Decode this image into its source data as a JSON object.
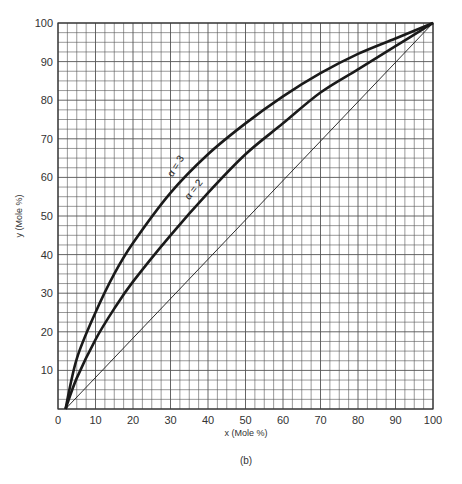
{
  "chart_data": {
    "type": "line",
    "title": "",
    "caption": "(b)",
    "xlabel": "x  (Mole %)",
    "ylabel": "y  (Mole %)",
    "xlim": [
      0,
      100
    ],
    "ylim": [
      0,
      100
    ],
    "grid": true,
    "grid_minor_step": 2.5,
    "x_ticks": [
      "0",
      "10",
      "20",
      "30",
      "40",
      "50",
      "60",
      "70",
      "80",
      "90",
      "100"
    ],
    "y_ticks": [
      "10",
      "20",
      "30",
      "40",
      "50",
      "60",
      "70",
      "80",
      "90",
      "100"
    ],
    "series": [
      {
        "name": "α = 3",
        "label": "α = 3",
        "x": [
          2,
          5,
          10,
          15,
          20,
          30,
          40,
          50,
          60,
          70,
          80,
          90,
          100
        ],
        "y": [
          0,
          13,
          25,
          35,
          43,
          56,
          66,
          74,
          81,
          87,
          92,
          96,
          100
        ]
      },
      {
        "name": "α = 2",
        "label": "α = 2",
        "x": [
          2,
          5,
          10,
          15,
          20,
          30,
          40,
          50,
          60,
          70,
          80,
          90,
          100
        ],
        "y": [
          0,
          8,
          18,
          26,
          33,
          45,
          56,
          66,
          74,
          82,
          88,
          94,
          100
        ]
      },
      {
        "name": "diagonal",
        "label": "",
        "x": [
          2,
          100
        ],
        "y": [
          0,
          100
        ]
      }
    ],
    "legend": "none (inline labels on curves)"
  }
}
